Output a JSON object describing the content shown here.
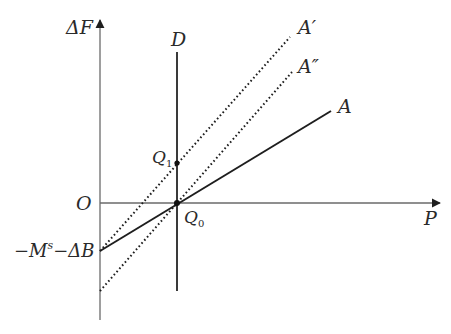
{
  "diagram": {
    "axes": {
      "y_label": "ΔF",
      "x_label": "P",
      "origin_label": "O",
      "intercept_label_prefix": "−M",
      "intercept_label_sup": "s",
      "intercept_label_suffix": "−ΔB"
    },
    "lines": {
      "D": "D",
      "A": "A",
      "A_prime": "A′",
      "A_double_prime": "A″"
    },
    "points": {
      "Q0": {
        "base": "Q",
        "sub": "0"
      },
      "Q1": {
        "base": "Q",
        "sub": "1"
      }
    },
    "colors": {
      "axis": "#6a6a6a",
      "line": "#1e1e1e",
      "text": "#2a2a2a"
    }
  }
}
